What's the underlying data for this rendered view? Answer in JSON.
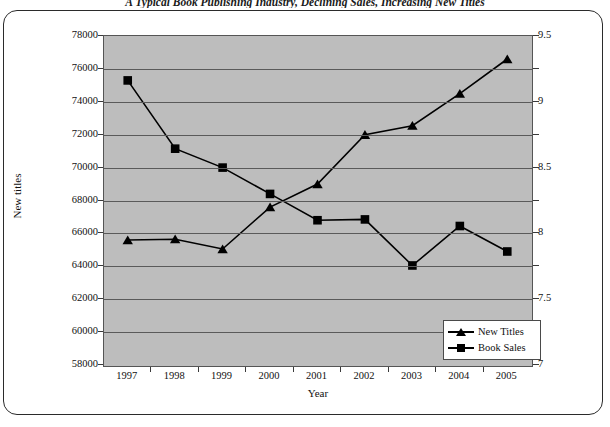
{
  "title": "A Typical Book Publishing Industry, Declining Sales, Increasing New Titles",
  "axis": {
    "x_label": "Year",
    "y_left_label": "New titles",
    "y_left_ticks": [
      "78000",
      "76000",
      "74000",
      "72000",
      "70000",
      "68000",
      "66000",
      "64000",
      "62000",
      "60000",
      "58000"
    ],
    "y_right_ticks": [
      "9.5",
      "9",
      "8.5",
      "8",
      "7.5",
      "7"
    ],
    "x_ticks": [
      "1997",
      "1998",
      "1999",
      "2000",
      "2001",
      "2002",
      "2003",
      "2004",
      "2005"
    ]
  },
  "legend": {
    "position": "bottom-right",
    "items": [
      {
        "label": "New Titles",
        "marker": "triangle-marker"
      },
      {
        "label": "Book Sales",
        "marker": "square-marker"
      }
    ]
  },
  "chart_data": {
    "type": "line",
    "title": "A Typical Book Publishing Industry, Declining Sales, Increasing New Titles",
    "xlabel": "Year",
    "ylabel": "New titles",
    "y2label": "",
    "x": [
      "1997",
      "1998",
      "1999",
      "2000",
      "2001",
      "2002",
      "2003",
      "2004",
      "2005"
    ],
    "ylim": [
      58000,
      78000
    ],
    "y2lim": [
      7,
      9.5
    ],
    "ytick_step": 2000,
    "y2tick_step": 0.5,
    "grid": true,
    "series": [
      {
        "name": "New Titles",
        "axis": "left",
        "marker": "triangle",
        "values": [
          65600,
          65650,
          65050,
          67600,
          69000,
          72000,
          72550,
          74500,
          76600
        ]
      },
      {
        "name": "Book Sales",
        "axis": "right",
        "marker": "square",
        "values": [
          9.15,
          8.65,
          8.5,
          8.3,
          8.1,
          8.1,
          7.9,
          8.05,
          7.85
        ],
        "values_on_left_scale": [
          75300,
          71150,
          70000,
          68400,
          66800,
          66850,
          64050,
          66450,
          64900
        ]
      }
    ]
  }
}
